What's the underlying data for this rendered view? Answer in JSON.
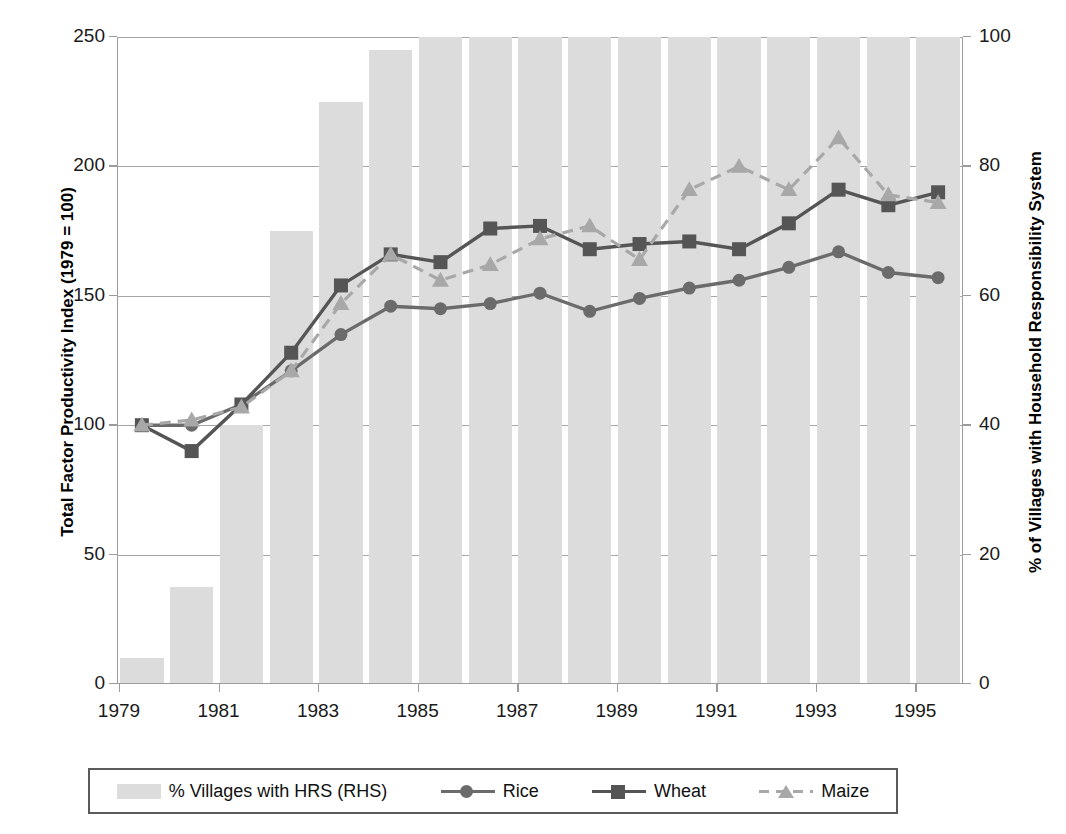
{
  "chart_data": {
    "type": "bar",
    "title": "",
    "xlabel": "",
    "ylabel": "Total Factor Productivity Index (1979 = 100)",
    "y2label": "% of Villages with Household Responsibility System",
    "ylim": [
      0,
      250
    ],
    "y2lim": [
      0,
      100
    ],
    "yticks": [
      0,
      50,
      100,
      150,
      200,
      250
    ],
    "y2ticks": [
      0,
      20,
      40,
      60,
      80,
      100
    ],
    "grid": true,
    "legend_position": "bottom",
    "x": [
      1979,
      1980,
      1981,
      1982,
      1983,
      1984,
      1985,
      1986,
      1987,
      1988,
      1989,
      1990,
      1991,
      1992,
      1993,
      1994,
      1995
    ],
    "xtick_labels": [
      "1979",
      "1981",
      "1983",
      "1985",
      "1987",
      "1989",
      "1991",
      "1993",
      "1995"
    ],
    "xtick_values": [
      1979,
      1981,
      1983,
      1985,
      1987,
      1989,
      1991,
      1993,
      1995
    ],
    "categories": [
      "1979",
      "1980",
      "1981",
      "1982",
      "1983",
      "1984",
      "1985",
      "1986",
      "1987",
      "1988",
      "1989",
      "1990",
      "1991",
      "1992",
      "1993",
      "1994",
      "1995"
    ],
    "series": [
      {
        "name": "% Villages with HRS (RHS)",
        "kind": "bar",
        "axis": "right",
        "color": "#dcdcdc",
        "values": [
          4,
          15,
          40,
          70,
          90,
          98,
          100,
          100,
          100,
          100,
          100,
          100,
          100,
          100,
          100,
          100,
          100
        ]
      },
      {
        "name": "Rice",
        "kind": "line",
        "axis": "left",
        "marker": "circle",
        "dash": "solid",
        "color": "#6b6b6b",
        "values": [
          100,
          100,
          108,
          121,
          135,
          146,
          145,
          147,
          151,
          144,
          149,
          153,
          156,
          161,
          167,
          159,
          157
        ]
      },
      {
        "name": "Wheat",
        "kind": "line",
        "axis": "left",
        "marker": "square",
        "dash": "solid",
        "color": "#555555",
        "values": [
          100,
          90,
          108,
          128,
          154,
          166,
          163,
          176,
          177,
          168,
          170,
          171,
          168,
          178,
          191,
          185,
          190
        ]
      },
      {
        "name": "Maize",
        "kind": "line",
        "axis": "left",
        "marker": "triangle",
        "dash": "dashed",
        "color": "#a8a8a8",
        "values": [
          100,
          102,
          107,
          121,
          147,
          166,
          156,
          162,
          172,
          177,
          164,
          191,
          200,
          191,
          211,
          189,
          186
        ]
      }
    ]
  },
  "legend": {
    "items": [
      {
        "label": "% Villages with HRS (RHS)",
        "type": "bar"
      },
      {
        "label": "Rice",
        "type": "line-circle"
      },
      {
        "label": "Wheat",
        "type": "line-square"
      },
      {
        "label": "Maize",
        "type": "line-triangle-dashed"
      }
    ]
  },
  "colors": {
    "bar": "#dcdcdc",
    "rice": "#6b6b6b",
    "wheat": "#555555",
    "maize": "#a8a8a8",
    "grid": "#a6a6a6",
    "axis": "#9b9b9b",
    "text": "#111111"
  }
}
